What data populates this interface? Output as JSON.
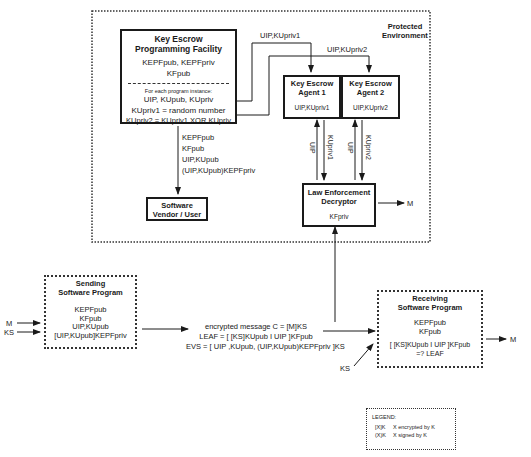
{
  "protected_environment": {
    "label_line1": "Protected",
    "label_line2": "Environment"
  },
  "kepf": {
    "title_line1": "Key Escrow",
    "title_line2": "Programming Facility",
    "keys_line1": "KEPFpub, KEPFpriv",
    "keys_line2": "KFpub",
    "instance_caption": "For each program instance:",
    "line1": "UIP, KUpub, KUpriv",
    "line2": "KUpriv1 = random number",
    "line3": "KUpriv2 = KUpriv1 XOR KUpriv"
  },
  "vendor_flow": {
    "line1": "KEPFpub",
    "line2": "KFpub",
    "line3": "UIP,KUpub",
    "line4": "(UIP,KUpub)KEPFpriv"
  },
  "vendor": {
    "title_line1": "Software",
    "title_line2": "Vendor / User"
  },
  "agent1": {
    "title_line1": "Key Escrow",
    "title_line2": "Agent 1",
    "value": "UIP,KUpriv1",
    "flow_in": "UIP,KUpriv1",
    "up_label": "UIP",
    "down_label": "KUpriv1"
  },
  "agent2": {
    "title_line1": "Key Escrow",
    "title_line2": "Agent 2",
    "value": "UIP,KUpriv2",
    "flow_in": "UIP,KUpriv2",
    "up_label": "UIP",
    "down_label": "KUpriv2"
  },
  "decryptor": {
    "title_line1": "Law Enforcement",
    "title_line2": "Decryptor",
    "value": "KFpriv",
    "output": "M"
  },
  "sender": {
    "title_line1": "Sending",
    "title_line2": "Software Program",
    "line1": "KEPFpub",
    "line2": "KFpub",
    "line3": "UIP,KUpub",
    "line4": "[UIP,KUpub]KEPFpriv",
    "input_m": "M",
    "input_ks": "KS"
  },
  "message": {
    "line1": "encrypted message C = [M]KS",
    "line2": "LEAF = [ [KS]KUpub I UIP ]KFpub",
    "line3": "EVS = [ UIP ,KUpub, (UIP,KUpub)KEPFpriv ]KS"
  },
  "receiver": {
    "title_line1": "Receiving",
    "title_line2": "Software Program",
    "line1": "KEPFpub",
    "line2": "KFpub",
    "line3": "[ [KS]KUpub I UIP ]KFpub",
    "line4": "=? LEAF",
    "input_ks": "KS",
    "output": "M"
  },
  "legend": {
    "title": "LEGEND:",
    "row1_symbol": "[X]K",
    "row1_text": "X encrypted by K",
    "row2_symbol": "(X)K",
    "row2_text": "X signed by K"
  }
}
